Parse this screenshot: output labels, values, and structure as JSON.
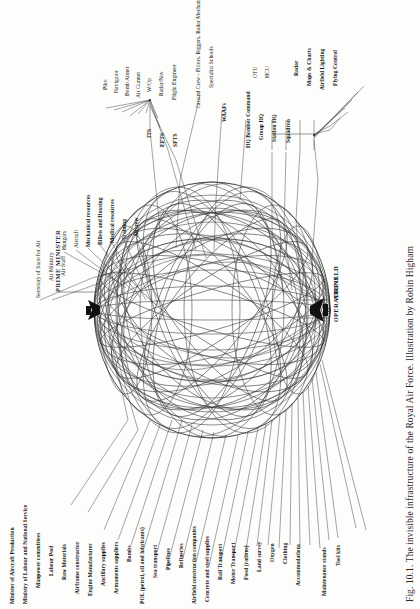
{
  "figure": {
    "caption": "Fig. 10.1. The invisible infrastructure of the Royal Air Force. Illustration by Robin Higham",
    "orientation": "rotated-90-ccw",
    "background_color": "#fdfdfc",
    "ink_color": "#1a1a1a"
  },
  "hubs": {
    "prime_minister": "PRIME MINISTER",
    "airfield": "AIRFIELD",
    "operations": "OPERATIONS"
  },
  "chain_air_ministry": [
    {
      "label": "Secretary of State for Air"
    },
    {
      "label": "Air Ministry"
    },
    {
      "label": "Air Staff"
    }
  ],
  "station_resources": [
    {
      "label": "Hangars"
    },
    {
      "label": "Aircraft"
    },
    {
      "label": "Mechanical resources"
    },
    {
      "label": "Billets and Housing"
    },
    {
      "label": "Medical resources"
    },
    {
      "label": "Training"
    },
    {
      "label": "Aircrew"
    }
  ],
  "training_schools": [
    {
      "label": "ITS"
    },
    {
      "label": "EFTS"
    },
    {
      "label": "SFTS"
    }
  ],
  "aircrew_trades": [
    {
      "label": "Pilot"
    },
    {
      "label": "Navigator"
    },
    {
      "label": "Bomb Aimer"
    },
    {
      "label": "Air Gunner"
    },
    {
      "label": "W/Op"
    },
    {
      "label": "Radar/Nav"
    },
    {
      "label": "Flight Engineer"
    }
  ],
  "ground_support": [
    {
      "label": "Ground Crew - Fitters, Riggers, Radar Mechanics"
    },
    {
      "label": "Specialist Schools"
    },
    {
      "label": "WAAFs"
    }
  ],
  "command_chain": [
    {
      "label": "HQ Bomber Command"
    },
    {
      "label": "Group HQ"
    },
    {
      "label": "Station HQ"
    },
    {
      "label": "Squadron"
    }
  ],
  "conversion_units": [
    {
      "label": "OTU"
    },
    {
      "label": "HCU"
    }
  ],
  "squadron_services": [
    {
      "label": "Radar"
    },
    {
      "label": "Maps & Charts"
    },
    {
      "label": "Airfield Lighting"
    },
    {
      "label": "Flying Control"
    }
  ],
  "supply_chain": [
    {
      "label": "Minister of Aircraft Production"
    },
    {
      "label": "Ministry of Labour and National Service"
    },
    {
      "label": "Manpower committees"
    },
    {
      "label": "Labour Pool"
    },
    {
      "label": "Raw Materials"
    },
    {
      "label": "Airframe constructor"
    },
    {
      "label": "Engine Manufacturer"
    },
    {
      "label": "Ancillary supplies"
    },
    {
      "label": "Armaments suppliers"
    },
    {
      "label": "Bombs"
    },
    {
      "label": "POL (petrol, oil and lubricants)"
    },
    {
      "label": "Sea transport"
    },
    {
      "label": "Pipelines"
    },
    {
      "label": "Refineries"
    },
    {
      "label": "Airfield construction companies"
    },
    {
      "label": "Concrete and steel supplies"
    },
    {
      "label": "Rail Transport"
    },
    {
      "label": "Motor Transport"
    },
    {
      "label": "Food (rations)"
    },
    {
      "label": "Land survey"
    },
    {
      "label": "Oxygen"
    },
    {
      "label": "Clothing"
    },
    {
      "label": "Accommodations"
    },
    {
      "label": "Maintenance stands"
    },
    {
      "label": "Tool kits"
    }
  ]
}
